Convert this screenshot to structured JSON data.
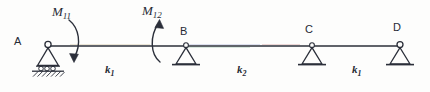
{
  "figure": {
    "type": "structural-beam-diagram",
    "line_color": "#2b2f3a",
    "label_color": "#262a35"
  },
  "beam": {
    "label": "beam-member",
    "start_x": 48,
    "end_x": 400,
    "y": 46
  },
  "supports": [
    {
      "id": "A",
      "label": "A",
      "type": "roller-on-hatched-ground",
      "x": 48,
      "label_x": 14,
      "label_y": 36,
      "has_hinge_circle": true,
      "has_hatching": true,
      "has_rollers": true
    },
    {
      "id": "B",
      "label": "B",
      "type": "pin",
      "x": 186,
      "label_x": 180,
      "label_y": 26,
      "has_hinge_circle": true,
      "has_hatching": false,
      "has_rollers": false
    },
    {
      "id": "C",
      "label": "C",
      "type": "pin",
      "x": 312,
      "label_x": 305,
      "label_y": 24,
      "has_hinge_circle": true,
      "has_hatching": false,
      "has_rollers": false
    },
    {
      "id": "D",
      "label": "D",
      "type": "pin",
      "x": 400,
      "label_x": 393,
      "label_y": 22,
      "has_hinge_circle": true,
      "has_hatching": false,
      "has_rollers": false
    }
  ],
  "moments": [
    {
      "id": "M11",
      "symbol": "M",
      "subscript": "11",
      "sense": "clockwise",
      "applied_at": "A",
      "label_x": 52,
      "label_y": 5,
      "arrow_x": 75,
      "arrowhead_direction": "down"
    },
    {
      "id": "M12",
      "symbol": "M",
      "subscript": "12",
      "sense": "counterclockwise",
      "applied_at": "span-AB-near-B",
      "label_x": 142,
      "label_y": 4,
      "arrow_x": 160,
      "arrowhead_direction": "up"
    }
  ],
  "span_stiffnesses": [
    {
      "id": "k1-left",
      "symbol": "k",
      "subscript": "1",
      "span": "A-B",
      "label_x": 105,
      "label_y": 64
    },
    {
      "id": "k2",
      "symbol": "k",
      "subscript": "2",
      "span": "B-C",
      "label_x": 237,
      "label_y": 64
    },
    {
      "id": "k1-right",
      "symbol": "k",
      "subscript": "1",
      "span": "C-D",
      "label_x": 352,
      "label_y": 64
    }
  ]
}
